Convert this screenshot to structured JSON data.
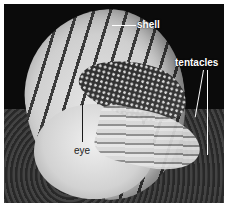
{
  "image": {
    "subject": "Chambered nautilus photograph",
    "style": "grayscale"
  },
  "labels": [
    {
      "id": "shell",
      "text": "shell"
    },
    {
      "id": "tentacles",
      "text": "tentacles"
    },
    {
      "id": "eye",
      "text": "eye"
    }
  ]
}
